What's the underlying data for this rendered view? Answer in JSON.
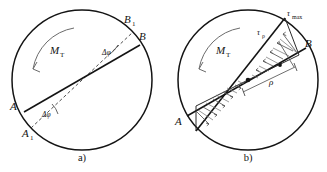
{
  "figure": {
    "background_color": "#ffffff",
    "stroke_color": "#141414",
    "width": 327,
    "height": 172
  },
  "panels": [
    {
      "id": "a",
      "caption": "a)",
      "description": "Cross-section showing angle of twist of a diameter",
      "geometry": {
        "center_x": 82,
        "center_y": 80,
        "radius": 70
      },
      "torque": {
        "symbol": "M",
        "subscript": "T",
        "direction": "counterclockwise"
      },
      "points": [
        {
          "label": "A",
          "subscript": "",
          "x": 16,
          "y": 106
        },
        {
          "label": "A",
          "subscript": "1",
          "x": 25,
          "y": 133
        },
        {
          "label": "B",
          "subscript": "",
          "x": 136,
          "y": 36
        },
        {
          "label": "B",
          "subscript": "1",
          "x": 123,
          "y": 20
        }
      ],
      "angles": [
        {
          "label": "Δφ",
          "position": "upper",
          "x": 104,
          "y": 50
        },
        {
          "label": "Δφ",
          "position": "lower",
          "x": 44,
          "y": 113
        }
      ]
    },
    {
      "id": "b",
      "caption": "b)",
      "description": "Cross-section showing linear shear stress distribution along a diameter",
      "geometry": {
        "center_x": 85,
        "center_y": 80,
        "radius": 70
      },
      "torque": {
        "symbol": "M",
        "subscript": "T",
        "direction": "counterclockwise"
      },
      "points": [
        {
          "label": "A",
          "subscript": "",
          "x": 17,
          "y": 121
        },
        {
          "label": "B",
          "subscript": "",
          "x": 139,
          "y": 43
        }
      ],
      "stresses": [
        {
          "label": "τ",
          "subscript": "max",
          "x": 113,
          "y": 14
        },
        {
          "label": "τ",
          "subscript": "ρ",
          "x": 88,
          "y": 34
        }
      ],
      "dimensions": [
        {
          "label": "ρ",
          "x": 110,
          "y": 80
        }
      ]
    }
  ]
}
